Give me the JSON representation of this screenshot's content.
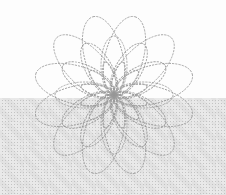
{
  "figure": {
    "canvas": {
      "width": 226,
      "height": 195
    },
    "center": {
      "x": 114,
      "y": 95
    },
    "stroke": {
      "color": "#979797",
      "width": 0.9,
      "dasharray": "2.2 1.1",
      "opacity": 0.9
    },
    "rings": [
      {
        "name": "outer-loops",
        "count": 12,
        "rx": 40.5,
        "ry": 19,
        "start_angle_deg": 105
      },
      {
        "name": "middle-loops",
        "count": 12,
        "rx": 29.5,
        "ry": 13,
        "start_angle_deg": 90
      },
      {
        "name": "inner-petals",
        "count": 12,
        "rx": 17,
        "ry": 5.5,
        "start_angle_deg": 105
      }
    ],
    "background": {
      "top_color": "#fdfdfd",
      "split_y": 98,
      "halftone_base": "#e7e7e7",
      "halftone_dot": "#c3c3c3"
    }
  }
}
